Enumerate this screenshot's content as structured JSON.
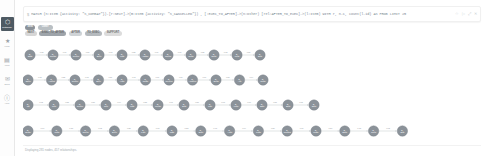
{
  "app": {
    "name": "neo4j-browser"
  },
  "sidebar": {
    "items": [
      {
        "name": "database",
        "glyph": "⬡",
        "label": "Database",
        "active": true
      },
      {
        "name": "favorites",
        "glyph": "★",
        "label": "Favs",
        "active": false
      },
      {
        "name": "project-files",
        "glyph": "▤",
        "label": "Files",
        "active": false
      },
      {
        "name": "documents",
        "glyph": "✉",
        "label": "Docs",
        "active": false
      },
      {
        "name": "about",
        "glyph": "ⓘ",
        "label": "Help",
        "active": false
      }
    ]
  },
  "editor": {
    "prompt": "$",
    "query": "MATCH (n:Item {activity: \"S_COMBAT\"})-[r:NEXT]->(m:Item {activity: \"S_CANCELLED\"}) , [:EXEC_TO_AFTER]->(n:Other) [rel:AFTER_TO_EXEC]->(l:Item) WITH r, n.c, count(l.id) AS PROB LIMIT 25",
    "icons": [
      {
        "name": "favorite-star-icon",
        "glyph": "☆"
      },
      {
        "name": "run-query-icon",
        "glyph": "▷"
      },
      {
        "name": "expand-icon",
        "glyph": "⤢"
      },
      {
        "name": "close-icon",
        "glyph": "✕"
      }
    ]
  },
  "legend": {
    "node_labels": [
      {
        "name": "Item",
        "count": "281",
        "color": "#8b9299"
      },
      {
        "name": "Other",
        "count": "*",
        "color": "#b0b6bb"
      }
    ],
    "relationship_types": [
      {
        "name": "NEXT",
        "count": "*"
      },
      {
        "name": "EXEC_TO_AFTER",
        "count": "*"
      },
      {
        "name": "AFTER_TO_EXEC",
        "count": "*"
      }
    ],
    "row1": [
      {
        "kind": "label",
        "text": "Item",
        "color": "#8b9299",
        "w": 9
      },
      {
        "kind": "label",
        "text": "Other",
        "color": "#b9bfc3",
        "w": 15
      }
    ],
    "row2": [
      {
        "kind": "count",
        "text": "NEXT",
        "color": "#d6d6d6",
        "w": 8
      },
      {
        "kind": "count",
        "text": "EXEC_TO_AFTER",
        "color": "#9ea4aa",
        "w": 16
      },
      {
        "kind": "count",
        "text": "AFTER",
        "color": "#cfd3d6",
        "w": 10
      },
      {
        "kind": "count",
        "text": "TO_EXEC",
        "color": "#b5babe",
        "w": 11
      },
      {
        "kind": "count",
        "text": "SUPPORT",
        "color": "#dcdcdc",
        "w": 12
      }
    ]
  },
  "graph": {
    "node_radius": 5.2,
    "rows": [
      {
        "y": 16,
        "x_start": 7,
        "spacing": 23.0,
        "count": 11,
        "labels": [
          "S_Start",
          "S_Create",
          "S_Queue",
          "S_Exec",
          "S_Wait",
          "S_Assign",
          "S_Check",
          "S_Close",
          "S_Done",
          "S_Final",
          "S_End"
        ],
        "edge_labels": [
          "0.98",
          "0.91",
          "0.87",
          "0.93",
          "0.88",
          "0.96",
          "0.90",
          "0.85",
          "0.92",
          "0.89"
        ]
      },
      {
        "y": 41,
        "x_start": 5,
        "spacing": 23.5,
        "count": 11,
        "labels": [
          "S_Open",
          "S_Accept",
          "S_Queue",
          "S_Exec",
          "S_Hold",
          "S_Route",
          "S_Review",
          "S_Approve",
          "S_Send",
          "S_Ack",
          "S_Close"
        ],
        "edge_labels": [
          "0.95",
          "0.88",
          "0.93",
          "0.86",
          "0.91",
          "0.97",
          "0.84",
          "0.90",
          "0.87",
          "0.94"
        ]
      },
      {
        "y": 66,
        "x_start": 5,
        "spacing": 26.0,
        "count": 12,
        "labels": [
          "S_Init",
          "S_Pick",
          "S_Queue",
          "S_Run",
          "S_Wait",
          "S_Merge",
          "S_Split",
          "S_Join",
          "S_Verify",
          "S_Sign",
          "S_Emit",
          "S_Stop"
        ],
        "edge_labels": [
          "0.92",
          "0.85",
          "0.89",
          "0.94",
          "0.88",
          "0.91",
          "0.86",
          "0.93",
          "0.90",
          "0.87",
          "0.95"
        ]
      },
      {
        "y": 92,
        "x_start": 5,
        "spacing": 28.8,
        "count": 14,
        "labels": [
          "S_Begin",
          "S_Load",
          "S_Queue",
          "S_Exec",
          "S_Fork",
          "S_Task",
          "S_Scan",
          "S_Audit",
          "S_Pass",
          "S_Commit",
          "S_Notify",
          "S_Store",
          "S_Clear",
          "S_End"
        ],
        "edge_labels": [
          "0.96",
          "0.89",
          "0.92",
          "0.85",
          "0.93",
          "0.88",
          "0.91",
          "0.94",
          "0.87",
          "0.90",
          "0.86",
          "0.95",
          "0.92"
        ]
      }
    ]
  },
  "status": {
    "text": "Displaying 281 nodes, 457 relationships."
  }
}
